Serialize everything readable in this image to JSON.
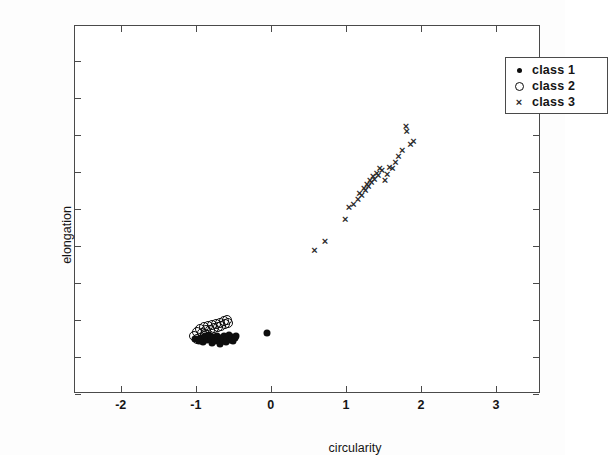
{
  "chart_data": {
    "type": "scatter",
    "title": "",
    "xlabel": "circularity",
    "ylabel": "elongation",
    "xlim": [
      -2.61,
      3.6
    ],
    "ylim": [
      -1.5,
      3.47
    ],
    "xticks": [
      -2,
      -1,
      0,
      1,
      2,
      3
    ],
    "xticklabels": [
      "-2",
      "-1",
      "0",
      "1",
      "2",
      "3"
    ],
    "yticks": [
      -1.5,
      -1,
      -0.5,
      0,
      0.5,
      1,
      1.5,
      2,
      2.5,
      3
    ],
    "yticklabels": [
      "-1.5",
      "-1",
      "-0.5",
      "0",
      "0.5",
      "1",
      "1.5",
      "2",
      "2.5",
      "3"
    ],
    "grid": false,
    "legend_position": "upper right",
    "series": [
      {
        "name": "class 1",
        "marker": "filled-dot",
        "color": "#0d0d0d",
        "points": [
          [
            -1.01,
            -0.76
          ],
          [
            -0.96,
            -0.78
          ],
          [
            -0.93,
            -0.74
          ],
          [
            -0.9,
            -0.8
          ],
          [
            -0.88,
            -0.72
          ],
          [
            -0.85,
            -0.77
          ],
          [
            -0.83,
            -0.7
          ],
          [
            -0.8,
            -0.75
          ],
          [
            -0.79,
            -0.81
          ],
          [
            -0.76,
            -0.73
          ],
          [
            -0.74,
            -0.79
          ],
          [
            -0.72,
            -0.71
          ],
          [
            -0.7,
            -0.76
          ],
          [
            -0.68,
            -0.82
          ],
          [
            -0.66,
            -0.74
          ],
          [
            -0.64,
            -0.78
          ],
          [
            -0.62,
            -0.72
          ],
          [
            -0.6,
            -0.8
          ],
          [
            -0.58,
            -0.75
          ],
          [
            -0.56,
            -0.7
          ],
          [
            -0.54,
            -0.77
          ],
          [
            -0.52,
            -0.73
          ],
          [
            -0.5,
            -0.79
          ],
          [
            -0.48,
            -0.74
          ],
          [
            -0.46,
            -0.71
          ],
          [
            -0.05,
            -0.68
          ]
        ]
      },
      {
        "name": "class 2",
        "marker": "open-circle",
        "color": "#0d0d0d",
        "points": [
          [
            -1.02,
            -0.72
          ],
          [
            -0.98,
            -0.66
          ],
          [
            -0.95,
            -0.62
          ],
          [
            -0.92,
            -0.67
          ],
          [
            -0.89,
            -0.6
          ],
          [
            -0.86,
            -0.64
          ],
          [
            -0.84,
            -0.58
          ],
          [
            -0.81,
            -0.63
          ],
          [
            -0.78,
            -0.57
          ],
          [
            -0.76,
            -0.61
          ],
          [
            -0.73,
            -0.55
          ],
          [
            -0.71,
            -0.59
          ],
          [
            -0.68,
            -0.54
          ],
          [
            -0.66,
            -0.58
          ],
          [
            -0.63,
            -0.52
          ],
          [
            -0.61,
            -0.56
          ],
          [
            -0.59,
            -0.5
          ],
          [
            -0.57,
            -0.54
          ],
          [
            -0.98,
            -0.76
          ],
          [
            -0.88,
            -0.69
          ]
        ]
      },
      {
        "name": "class 3",
        "marker": "cross",
        "color": "#2a2a2a",
        "points": [
          [
            0.58,
            0.45
          ],
          [
            0.72,
            0.57
          ],
          [
            0.99,
            0.86
          ],
          [
            1.04,
            1.03
          ],
          [
            1.1,
            1.07
          ],
          [
            1.16,
            1.14
          ],
          [
            1.18,
            1.22
          ],
          [
            1.21,
            1.19
          ],
          [
            1.24,
            1.28
          ],
          [
            1.26,
            1.25
          ],
          [
            1.28,
            1.34
          ],
          [
            1.3,
            1.31
          ],
          [
            1.32,
            1.39
          ],
          [
            1.34,
            1.36
          ],
          [
            1.36,
            1.44
          ],
          [
            1.38,
            1.41
          ],
          [
            1.41,
            1.49
          ],
          [
            1.43,
            1.46
          ],
          [
            1.45,
            1.55
          ],
          [
            1.48,
            1.52
          ],
          [
            1.52,
            1.39
          ],
          [
            1.55,
            1.47
          ],
          [
            1.58,
            1.57
          ],
          [
            1.62,
            1.55
          ],
          [
            1.66,
            1.64
          ],
          [
            1.7,
            1.72
          ],
          [
            1.75,
            1.8
          ],
          [
            1.8,
            2.12
          ],
          [
            1.81,
            2.05
          ],
          [
            1.86,
            1.88
          ],
          [
            1.9,
            1.92
          ]
        ]
      }
    ]
  },
  "legend": {
    "items": [
      {
        "label": "class 1",
        "marker": "filled-dot"
      },
      {
        "label": "class 2",
        "marker": "open-circle"
      },
      {
        "label": "class 3",
        "marker": "cross"
      }
    ]
  }
}
